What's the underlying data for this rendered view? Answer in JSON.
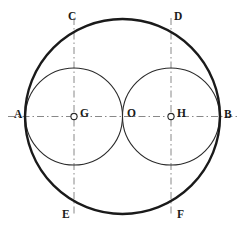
{
  "figure": {
    "canvas": {
      "width": 247,
      "height": 232
    },
    "background_color": "#ffffff",
    "ink_color": "#1a1a1a",
    "thin_color": "#6e6e6e",
    "axis_color": "#7a7a7a"
  },
  "points": [
    {
      "name": "A",
      "label": "A",
      "x": 26,
      "y": 116.5,
      "label_x": 14,
      "label_y": 109,
      "marker": "none"
    },
    {
      "name": "B",
      "label": "B",
      "x": 219,
      "y": 116.5,
      "label_x": 224,
      "label_y": 109,
      "marker": "none"
    },
    {
      "name": "C",
      "label": "C",
      "x": 74,
      "y": 32,
      "label_x": 68,
      "label_y": 11,
      "marker": "none"
    },
    {
      "name": "D",
      "label": "D",
      "x": 171,
      "y": 32,
      "label_x": 174,
      "label_y": 11,
      "marker": "none"
    },
    {
      "name": "E",
      "label": "E",
      "x": 74,
      "y": 201,
      "label_x": 62,
      "label_y": 209,
      "marker": "none"
    },
    {
      "name": "F",
      "label": "F",
      "x": 171,
      "y": 201,
      "label_x": 177,
      "label_y": 209,
      "marker": "none"
    },
    {
      "name": "G",
      "label": "G",
      "x": 74,
      "y": 116.5,
      "label_x": 80,
      "label_y": 108,
      "marker": "ring"
    },
    {
      "name": "H",
      "label": "H",
      "x": 171,
      "y": 116.5,
      "label_x": 177,
      "label_y": 108,
      "marker": "ring"
    },
    {
      "name": "O",
      "label": "O",
      "x": 122.5,
      "y": 116.5,
      "label_x": 127,
      "label_y": 108,
      "marker": "none"
    }
  ],
  "circles": [
    {
      "name": "outer-circle",
      "cx": 122.5,
      "cy": 116.5,
      "r": 97.5,
      "stroke_width": 2.4,
      "style": "solid-bold"
    },
    {
      "name": "left-inner-circle",
      "cx": 74,
      "cy": 116.5,
      "r": 48.5,
      "stroke_width": 1.1,
      "style": "solid-medium"
    },
    {
      "name": "right-inner-circle",
      "cx": 171,
      "cy": 116.5,
      "r": 48.5,
      "stroke_width": 1.1,
      "style": "solid-medium"
    }
  ],
  "arcs": [
    {
      "name": "arc-centered-at-B-through-A-C-E",
      "center": "B",
      "cx": 219,
      "cy": 116.5,
      "r": 97,
      "from": {
        "x": 122.5,
        "y": 116.5
      },
      "sweep": "through-C-left",
      "stroke_width": 0.8
    },
    {
      "name": "arc-centered-at-A-through-B-D-F",
      "center": "A",
      "cx": 26,
      "cy": 116.5,
      "r": 97,
      "from": {
        "x": 122.5,
        "y": 116.5
      },
      "sweep": "through-D-right",
      "stroke_width": 0.8
    }
  ],
  "axes": [
    {
      "name": "horizontal-axis-AB",
      "orientation": "horizontal",
      "x1": 8,
      "y1": 116.5,
      "x2": 240,
      "y2": 116.5,
      "style": "dash-dot"
    },
    {
      "name": "vertical-axis-CE",
      "orientation": "vertical",
      "x1": 74,
      "y1": 18,
      "x2": 74,
      "y2": 215,
      "style": "dash-dot"
    },
    {
      "name": "vertical-axis-DF",
      "orientation": "vertical",
      "x1": 171,
      "y1": 18,
      "x2": 171,
      "y2": 215,
      "style": "dash-dot"
    }
  ]
}
